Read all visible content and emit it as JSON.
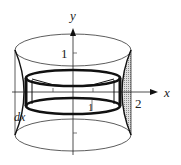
{
  "diagram": {
    "type": "cylindrical-shell-volume-of-revolution",
    "labels": {
      "y_axis": "y",
      "x_axis": "x",
      "y_tick_1": "1",
      "x_tick_2": "2",
      "x_tick_1": "1",
      "shell_thickness": "dx"
    },
    "colors": {
      "stroke": "#1a1a1a",
      "shade": "#b8b8b8",
      "background": "#ffffff"
    }
  }
}
